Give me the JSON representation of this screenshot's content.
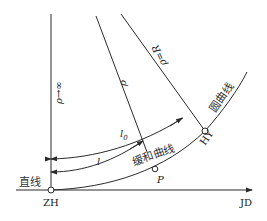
{
  "diagram": {
    "title": "",
    "labels": {
      "straight": "直线",
      "spiral": "缓和曲线",
      "circular": "圆曲线",
      "zh": "ZH",
      "hy": "HY",
      "jd": "JD",
      "p": "P",
      "l": "l",
      "l0": "l",
      "l0_sub": "0",
      "rho": "ρ",
      "rho_inf": "ρ→∞",
      "rho_r": "ρ=R"
    },
    "points": [
      {
        "id": "ZH",
        "description": "start of transition curve (straight to spiral)"
      },
      {
        "id": "P",
        "description": "point on transition curve"
      },
      {
        "id": "HY",
        "description": "end of transition curve (spiral to circular)"
      }
    ],
    "colors": {
      "line": "#2a2a2a",
      "text": "#222222",
      "background": "#ffffff"
    }
  }
}
